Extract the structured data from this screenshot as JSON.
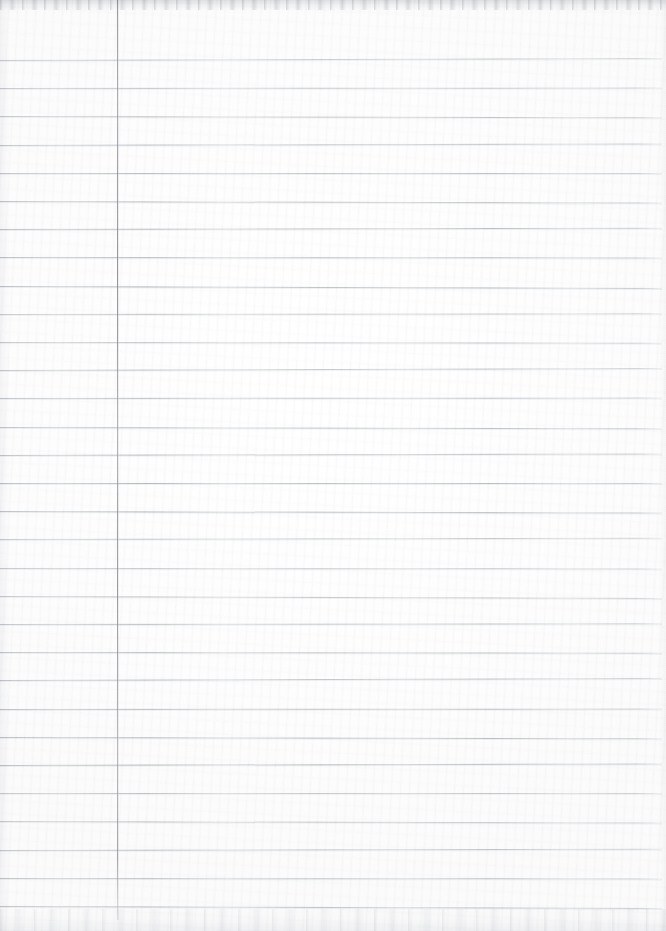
{
  "document": {
    "kind": "scanned-ruled-notebook-page",
    "title": "Blank Ruled Paper Scan",
    "content_text": "",
    "is_blank": true,
    "width_px": 666,
    "height_px": 931
  },
  "paper": {
    "background_color": "#fdfdfd",
    "highlight_color": "#ffffff",
    "edge_tint_color": "#e6e7eb"
  },
  "ruling": {
    "style": "wide-ruled-single-margin",
    "horizontal_line_color": "#969aa4",
    "horizontal_line_count": 31,
    "first_line_y": 60,
    "line_spacing_px": 28.2,
    "line_thickness_px": 1,
    "line_start_x": 0,
    "line_end_x": 662,
    "vertical_margin_line_color": "#7e828d",
    "vertical_margin_line_x": 117,
    "vertical_margin_line_top_y": 0,
    "vertical_margin_line_bottom_y": 920,
    "vertical_margin_line_thickness_px": 1
  },
  "scan_artifacts": {
    "top_edge_shadow_color": "#c4c6cb",
    "bottom_edge_shadow_color": "#e1e3e7",
    "side_vignette_color": "#e4e5e9",
    "grain_opacity": 0.55
  }
}
